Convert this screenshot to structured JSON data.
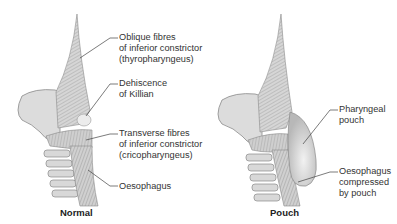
{
  "panels": [
    {
      "caption": "Normal",
      "labels": [
        {
          "line1": "Oblique fibres",
          "line2": "of inferior constrictor",
          "line3": "(thyropharyngeus)"
        },
        {
          "line1": "Dehiscence",
          "line2": "of Killian"
        },
        {
          "line1": "Transverse fibres",
          "line2": "of inferior constrictor",
          "line3": "(cricopharyngeus)"
        },
        {
          "line1": "Oesophagus"
        }
      ]
    },
    {
      "caption": "Pouch",
      "labels": [
        {
          "line1": "Pharyngeal",
          "line2": "pouch"
        },
        {
          "line1": "Oesophagus",
          "line2": "compressed",
          "line3": "by pouch"
        }
      ]
    }
  ],
  "colors": {
    "tissue_fill": "#d9d9d9",
    "tissue_dark": "#a8a8a8",
    "outline": "#8a8a8a",
    "leader_line": "#444444",
    "text": "#333333"
  }
}
